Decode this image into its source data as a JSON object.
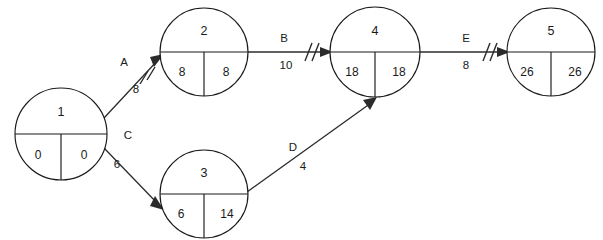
{
  "diagram": {
    "type": "activity-on-arrow-network",
    "background_color": "#ffffff",
    "line_color": "#2b2b2b",
    "text_color": "#1a1a1a",
    "nodes": [
      {
        "id": "node-1",
        "event_number": "1",
        "earliest_time": "0",
        "latest_time": "0",
        "cx": 61,
        "cy": 134,
        "r": 46
      },
      {
        "id": "node-2",
        "event_number": "2",
        "earliest_time": "8",
        "latest_time": "8",
        "cx": 204,
        "cy": 52,
        "r": 44
      },
      {
        "id": "node-3",
        "event_number": "3",
        "earliest_time": "6",
        "latest_time": "14",
        "cx": 204,
        "cy": 194,
        "r": 44
      },
      {
        "id": "node-4",
        "event_number": "4",
        "earliest_time": "18",
        "latest_time": "18",
        "cx": 375,
        "cy": 52,
        "r": 45
      },
      {
        "id": "node-5",
        "event_number": "5",
        "earliest_time": "26",
        "latest_time": "26",
        "cx": 551,
        "cy": 52,
        "r": 44
      }
    ],
    "edges": [
      {
        "id": "edge-a",
        "label": "A",
        "duration": "8",
        "from": "node-1",
        "to": "node-2",
        "hatched": true,
        "x1": 104,
        "y1": 118,
        "x2": 162,
        "y2": 56,
        "label_x": 124,
        "label_y": 63,
        "duration_x": 136,
        "duration_y": 90,
        "hatch_x": 147,
        "hatch_y": 75
      },
      {
        "id": "edge-b",
        "label": "B",
        "duration": "10",
        "from": "node-2",
        "to": "node-4",
        "hatched": true,
        "x1": 248,
        "y1": 52,
        "x2": 331,
        "y2": 52,
        "label_x": 284,
        "label_y": 39,
        "duration_x": 286,
        "duration_y": 66,
        "hatch_x": 312,
        "hatch_y": 52
      },
      {
        "id": "edge-c",
        "label": "C",
        "duration": "6",
        "from": "node-1",
        "to": "node-3",
        "hatched": false,
        "x1": 104,
        "y1": 148,
        "x2": 162,
        "y2": 208,
        "label_x": 128,
        "label_y": 136,
        "duration_x": 117,
        "duration_y": 165,
        "hatch_x": 0,
        "hatch_y": 0
      },
      {
        "id": "edge-d",
        "label": "D",
        "duration": "4",
        "from": "node-3",
        "to": "node-4",
        "hatched": false,
        "x1": 247,
        "y1": 192,
        "x2": 376,
        "y2": 99,
        "label_x": 293,
        "label_y": 148,
        "duration_x": 303,
        "duration_y": 167,
        "hatch_x": 0,
        "hatch_y": 0
      },
      {
        "id": "edge-e",
        "label": "E",
        "duration": "8",
        "from": "node-4",
        "to": "node-5",
        "hatched": true,
        "x1": 420,
        "y1": 52,
        "x2": 508,
        "y2": 52,
        "label_x": 466,
        "label_y": 39,
        "duration_x": 466,
        "duration_y": 66,
        "hatch_x": 490,
        "hatch_y": 52
      }
    ]
  }
}
